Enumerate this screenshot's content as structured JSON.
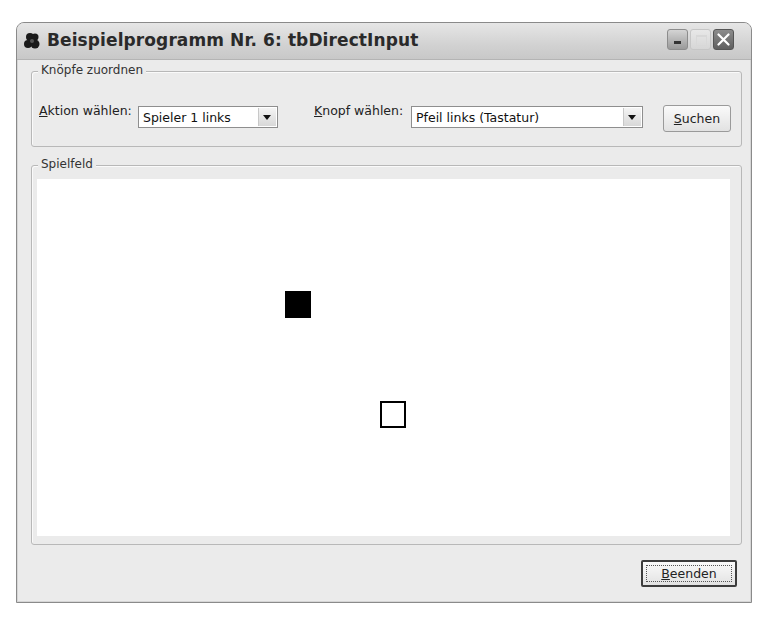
{
  "window": {
    "title": "Beispielprogramm Nr. 6: tbDirectInput",
    "icon": "app-icon",
    "controls": [
      "minimize",
      "maximize",
      "close"
    ]
  },
  "group_assign": {
    "legend": "Knöpfe zuordnen",
    "action_label": {
      "mnemonic": "A",
      "rest": "ktion wählen:"
    },
    "action_value": "Spieler 1 links",
    "button_label": {
      "mnemonic": "K",
      "rest": "nopf wählen:"
    },
    "button_value": "Pfeil links (Tastatur)",
    "search_button": {
      "mnemonic": "S",
      "rest": "uchen"
    }
  },
  "group_field": {
    "legend": "Spielfeld",
    "players": [
      {
        "name": "player-1",
        "style": "filled",
        "color": "#000000",
        "x": 284,
        "y": 290,
        "size": 26
      },
      {
        "name": "player-2",
        "style": "outline",
        "color": "#000000",
        "x": 379,
        "y": 400,
        "size": 26
      }
    ]
  },
  "footer": {
    "quit_button": {
      "mnemonic": "B",
      "rest": "eenden"
    }
  }
}
